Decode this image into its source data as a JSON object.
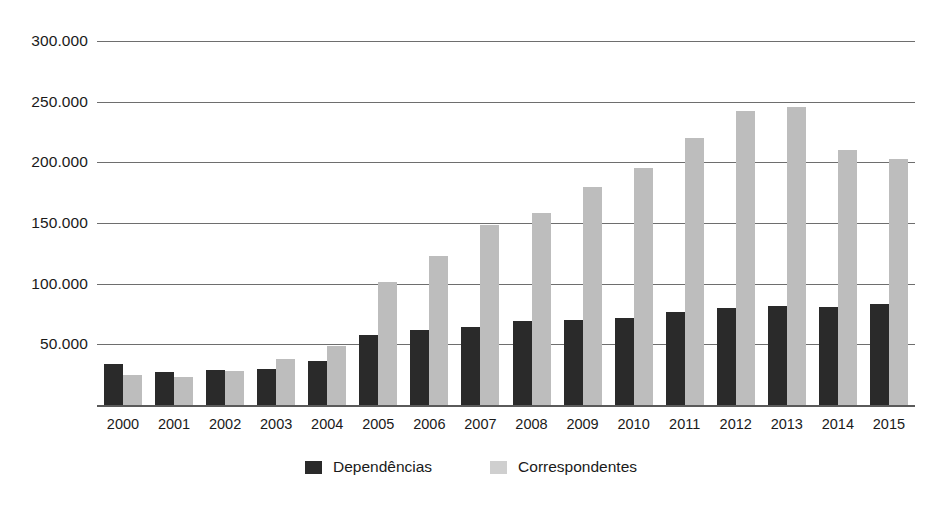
{
  "chart_data": {
    "type": "bar",
    "title": "",
    "subtitle": "",
    "xlabel": "",
    "ylabel": "",
    "categories": [
      "2000",
      "2001",
      "2002",
      "2003",
      "2004",
      "2005",
      "2006",
      "2007",
      "2008",
      "2009",
      "2010",
      "2011",
      "2012",
      "2013",
      "2014",
      "2015"
    ],
    "series": [
      {
        "name": "Dependências",
        "color": "#2a2a2a",
        "values": [
          34000,
          27000,
          29000,
          30000,
          36000,
          58000,
          62000,
          64000,
          69000,
          70000,
          72000,
          77000,
          80000,
          82000,
          81000,
          83000
        ]
      },
      {
        "name": "Correspondentes",
        "color": "#bdbdbd",
        "values": [
          25000,
          23000,
          28000,
          38000,
          49000,
          101000,
          123000,
          148000,
          158000,
          180000,
          195000,
          220000,
          242000,
          246000,
          210000,
          203000
        ]
      }
    ],
    "ylim": [
      0,
      300000
    ],
    "yticks": [
      50000,
      100000,
      150000,
      200000,
      250000,
      300000
    ],
    "ytick_labels": [
      "50.000",
      "100.000",
      "150.000",
      "200.000",
      "250.000",
      "300.000"
    ],
    "grid": true,
    "legend_position": "bottom"
  },
  "legend": {
    "items": [
      {
        "label": "Dependências",
        "swatch": "legend-swatch-dark"
      },
      {
        "label": "Correspondentes",
        "swatch": "legend-swatch-light"
      }
    ]
  }
}
